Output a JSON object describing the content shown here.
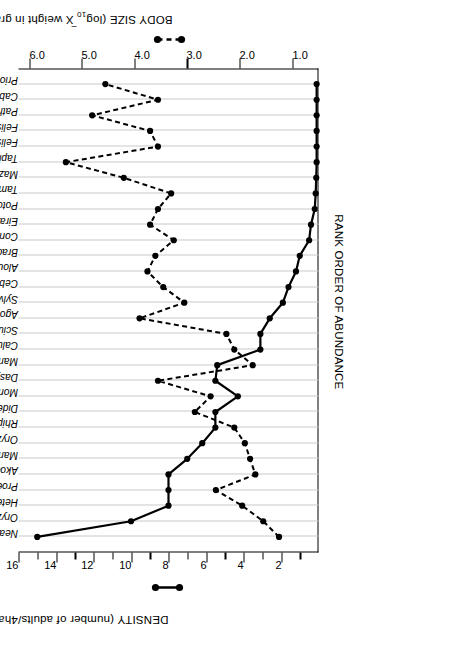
{
  "figure": {
    "density_axis_title": "DENSITY (number of adults/4ha)",
    "bodysize_axis_title_pre": "BODY SIZE (log",
    "bodysize_axis_title_sub": "10",
    "bodysize_axis_title_mid": " X weight in grams)",
    "rank_axis_title": "RANK ORDER OF ABUNDANCE"
  },
  "chart_data": {
    "type": "line",
    "title": "",
    "xlabel": "RANK ORDER OF ABUNDANCE",
    "ylabel": "DENSITY (number of adults/4ha)",
    "y2label": "BODY SIZE (log10 X weight in grams)",
    "ylim": [
      0,
      16
    ],
    "y2lim": [
      0.5,
      6.2
    ],
    "yticks": [
      2,
      4,
      6,
      8,
      10,
      12,
      14,
      16
    ],
    "y2ticks": [
      1.0,
      2.0,
      3.0,
      4.0,
      5.0,
      6.0
    ],
    "ytick_labels": [
      "2",
      "4",
      "6",
      "8",
      "10",
      "12",
      "14",
      "16"
    ],
    "y2tick_labels": [
      "1.0",
      "2.0",
      "3.0",
      "4.0",
      "5.0",
      "6.0"
    ],
    "grid": true,
    "legend_position": "axis-side",
    "categories": [
      "Neacomys tenuipes (spiny mouse)",
      "Oryzomys capito (rice rat)",
      "Heteromys anomalus (spiny pocket mouse)",
      "Proechimys semispinosus (spiny rat)",
      "Akodon urichi (South American field mouse)",
      "Marmosa fuscata (opossum)",
      "Oryzomys concolor (rice rat)",
      "Rhipidomys venezuelae (climbing rat)",
      "Didelphis marsupialis (opossum)",
      "Monodelphis brevicauda (short-tailed opossum)",
      "Dasyprocta agouti (agouti)",
      "Marmosa cinerea (mouse opossum)",
      "Caluromys philander (wooly opossum)",
      "Sciurus granatensis (squirrel)",
      "Agouti paca (paca)",
      "Sylvilagus braziliensis (rabbit)",
      "Cebus nigrivittatus (cebus monkey)",
      "Alouatta seniculus (howler monkey)",
      "Bradypus infuscatus (three-toed sloth)",
      "Conepatus semistriatus (skunk)",
      "Eira barbara (tayra)",
      "Potos flavus (kinkajou)",
      "Tamandua longicaudata (lesser anteater)",
      "Mazama americana (brocket deer)",
      "Tapirus terretris (tapir)",
      "Felis pardalis (ocelot)",
      "Felis yagouaroundi (jaguarundi)",
      "Pathera onca (jaguar)",
      "Cabassous unicinctus (naked-tailed armadillo)",
      "Priodontes gigantea (giant armadillo)"
    ],
    "series": [
      {
        "name": "DENSITY (number of adults/4ha)",
        "axis": "left",
        "style": "solid",
        "marker": "filled-circle",
        "values": [
          15.0,
          10.0,
          8.0,
          8.0,
          8.0,
          7.0,
          6.2,
          5.5,
          5.5,
          4.3,
          5.5,
          5.4,
          3.1,
          3.1,
          2.6,
          1.9,
          1.6,
          1.2,
          1.0,
          0.5,
          0.4,
          0.2,
          0.15,
          0.12,
          0.1,
          0.1,
          0.1,
          0.1,
          0.1,
          0.1
        ]
      },
      {
        "name": "BODY SIZE (log10 X weight in grams)",
        "axis": "right",
        "style": "dashed",
        "marker": "filled-circle",
        "values": [
          1.25,
          1.55,
          1.95,
          2.45,
          1.7,
          1.8,
          1.9,
          2.1,
          2.85,
          2.55,
          3.55,
          1.75,
          2.1,
          2.25,
          3.9,
          3.05,
          3.45,
          3.75,
          3.6,
          3.25,
          3.7,
          3.55,
          3.3,
          4.2,
          5.3,
          3.55,
          3.7,
          4.8,
          3.55,
          4.55
        ]
      }
    ]
  }
}
